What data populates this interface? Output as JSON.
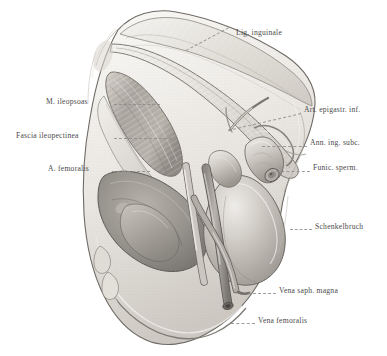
{
  "plate": {
    "title": "Schenkelbruch (femoral hernia) — inguinal region, right side",
    "domain": "anatomical-illustration",
    "width": 387,
    "height": 356,
    "background_color": "#ffffff",
    "ink_color": "#4a4a4a",
    "leader_color": "#8d8d8d"
  },
  "labels": [
    {
      "id": "lig-inguinale",
      "text": "Lig. inguinale",
      "side": "top",
      "text_x": 236,
      "text_y": 33,
      "leader": {
        "x1": 232,
        "y1": 40,
        "x2": 186,
        "y2": 63
      }
    },
    {
      "id": "m-ileopsoas",
      "text": "M. ileopsoas",
      "side": "left",
      "text_x": 46,
      "text_y": 101,
      "leader": {
        "x1": 114,
        "y1": 104,
        "x2": 160,
        "y2": 104
      }
    },
    {
      "id": "fascia-ileopectinea",
      "text": "Fascia ileopectinea",
      "side": "left",
      "text_x": 16,
      "text_y": 135,
      "leader": {
        "x1": 114,
        "y1": 138,
        "x2": 172,
        "y2": 138
      }
    },
    {
      "id": "a-femoralis",
      "text": "A. femoralis",
      "side": "left",
      "text_x": 48,
      "text_y": 168,
      "leader": {
        "x1": 112,
        "y1": 171,
        "x2": 150,
        "y2": 171
      }
    },
    {
      "id": "art-epigastr-inf",
      "text": "Art. epigastr. inf.",
      "side": "right",
      "text_x": 304,
      "text_y": 109,
      "leader": {
        "x1": 228,
        "y1": 130,
        "x2": 301,
        "y2": 113
      }
    },
    {
      "id": "ann-ing-subc",
      "text": "Ann. ing. subc.",
      "side": "right",
      "text_x": 310,
      "text_y": 142,
      "leader": {
        "x1": 262,
        "y1": 147,
        "x2": 307,
        "y2": 145
      }
    },
    {
      "id": "funic-sperm",
      "text": "Funic. sperm.",
      "side": "right",
      "text_x": 313,
      "text_y": 167,
      "leader": {
        "x1": 276,
        "y1": 173,
        "x2": 310,
        "y2": 170
      }
    },
    {
      "id": "schenkelbruch",
      "text": "Schenkelbruch",
      "side": "right",
      "text_x": 315,
      "text_y": 226,
      "leader": {
        "x1": 290,
        "y1": 229,
        "x2": 312,
        "y2": 229
      }
    },
    {
      "id": "vena-saph-magna",
      "text": "Vena saph. magna",
      "side": "right",
      "text_x": 279,
      "text_y": 290,
      "leader": {
        "x1": 248,
        "y1": 293,
        "x2": 276,
        "y2": 293
      }
    },
    {
      "id": "vena-femoralis",
      "text": "Vena femoralis",
      "side": "right",
      "text_x": 258,
      "text_y": 320,
      "leader": {
        "x1": 231,
        "y1": 323,
        "x2": 255,
        "y2": 323
      }
    }
  ],
  "structures": [
    {
      "id": "lig-inguinale-band",
      "name": "inguinal ligament band",
      "tone": "#e9e7e2"
    },
    {
      "id": "iliopsoas-muscle",
      "name": "iliopsoas muscle belly",
      "tone": "#b9b5ae"
    },
    {
      "id": "fascia-sheet",
      "name": "fascia lata sheet",
      "tone": "#dcd9d3"
    },
    {
      "id": "femoral-fossa",
      "name": "opened femoral sheath fossa",
      "tone": "#9d9a95"
    },
    {
      "id": "hernia-sac",
      "name": "femoral hernia sac",
      "tone": "#c8c4bd"
    },
    {
      "id": "spermatic-cord",
      "name": "spermatic cord stump",
      "tone": "#cfcbc4"
    },
    {
      "id": "femoral-vein",
      "name": "femoral vein",
      "tone": "#a7a39c"
    },
    {
      "id": "saphenous-vein",
      "name": "great saphenous vein",
      "tone": "#b2aea7"
    },
    {
      "id": "femoral-artery",
      "name": "femoral artery",
      "tone": "#cdc9c2"
    },
    {
      "id": "skin-margin",
      "name": "cut skin margin",
      "tone": "#e4e1db"
    }
  ]
}
